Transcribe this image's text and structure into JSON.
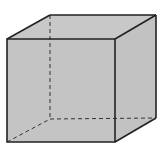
{
  "diagram": {
    "type": "cube-wireframe",
    "colors": {
      "background": "#ffffff",
      "face_fill": "#c4c4c4",
      "edge_stroke": "#222222",
      "hidden_edge_stroke": "#333333"
    },
    "vertices": {
      "front_top_left": [
        7,
        39
      ],
      "front_top_right": [
        115,
        39
      ],
      "front_bottom_left": [
        7,
        142
      ],
      "front_bottom_right": [
        115,
        142
      ],
      "back_top_left": [
        50,
        15
      ],
      "back_top_right": [
        156,
        15
      ],
      "back_bottom_left": [
        50,
        119
      ],
      "back_bottom_right": [
        156,
        118
      ]
    }
  }
}
